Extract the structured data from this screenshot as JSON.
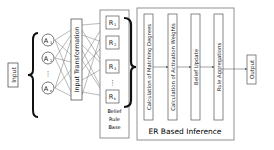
{
  "diagram": {
    "input_label": "Input",
    "antecedents": [
      {
        "label": "A",
        "sub": "1"
      },
      {
        "label": "A",
        "sub": "2"
      },
      {
        "label": "⋮",
        "sub": ""
      },
      {
        "label": "A",
        "sub": "n"
      }
    ],
    "input_transformation_label": "Input Transformation",
    "rules": [
      {
        "label": "R",
        "sub": "1"
      },
      {
        "label": "R",
        "sub": "2"
      },
      {
        "label": "R",
        "sub": "3"
      },
      {
        "label": "⋮",
        "sub": ""
      },
      {
        "label": "R",
        "sub": "k"
      }
    ],
    "rule_base_label_lines": [
      "Belief",
      "Rule",
      "Base"
    ],
    "er_steps": [
      "Calculation of Matching Degrees",
      "Calculation of Activation Weights",
      "Belief Update",
      "Rule Aggregations"
    ],
    "er_label": "ER Based Inference",
    "output_label": "Output"
  }
}
